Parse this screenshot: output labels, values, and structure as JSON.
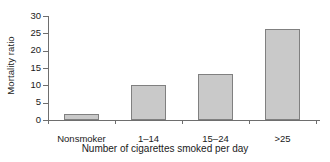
{
  "chart_data": {
    "type": "bar",
    "title": "",
    "xlabel": "Number of cigarettes smoked per day",
    "ylabel": "Mortality ratio",
    "categories": [
      "Nonsmoker",
      "1–14",
      "15–24",
      ">25"
    ],
    "values": [
      1.7,
      10.0,
      13.4,
      26.2
    ],
    "ylim": [
      0,
      30
    ],
    "yticks": [
      0,
      5,
      10,
      15,
      20,
      25,
      30
    ],
    "ytick_labels": [
      "0",
      "5",
      "10",
      "15",
      "20",
      "25",
      "30"
    ],
    "grid": false,
    "legend": null,
    "bar_fill_color": "#c9c9c9",
    "bar_edge_color": "#808080",
    "axis_color": "#6e6e6e",
    "background_color": "#ffffff"
  }
}
